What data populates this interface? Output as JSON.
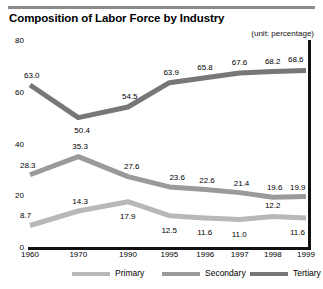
{
  "chart_data": {
    "type": "line",
    "title": "Composition of Labor Force by Industry",
    "unit_note": "(unit: percentage)",
    "xlabel": "",
    "ylabel": "",
    "categories": [
      "1960",
      "1970",
      "1990",
      "1995",
      "1996",
      "1997",
      "1998",
      "1999"
    ],
    "ylim": [
      0,
      80
    ],
    "yticks": [
      0,
      20,
      40,
      60,
      80
    ],
    "grid": false,
    "legend_position": "bottom",
    "series": [
      {
        "name": "Primary",
        "color": "#b8b8b8",
        "values": [
          8.7,
          14.3,
          17.9,
          12.5,
          11.6,
          11.0,
          12.2,
          11.6
        ]
      },
      {
        "name": "Secondary",
        "color": "#9a9a9a",
        "values": [
          28.3,
          35.3,
          27.6,
          23.6,
          22.6,
          21.4,
          19.6,
          19.9
        ]
      },
      {
        "name": "Tertiary",
        "color": "#777777",
        "values": [
          63.0,
          50.4,
          54.5,
          63.9,
          65.8,
          67.6,
          68.2,
          68.6
        ]
      }
    ]
  },
  "legend": {
    "items": [
      {
        "label": "Primary",
        "color": "#b8b8b8"
      },
      {
        "label": "Secondary",
        "color": "#9a9a9a"
      },
      {
        "label": "Tertiary",
        "color": "#777777"
      }
    ]
  }
}
